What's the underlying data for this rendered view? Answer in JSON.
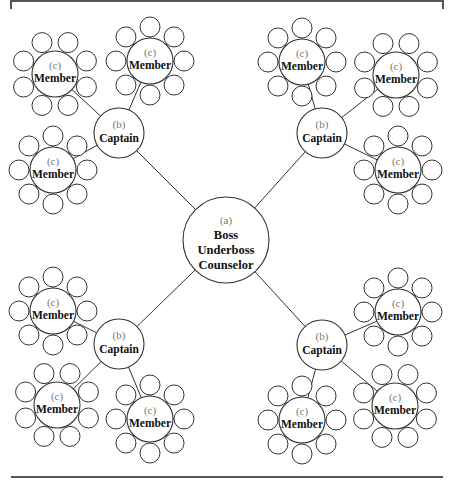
{
  "diagram": {
    "type": "hierarchy",
    "center": {
      "tag": "(a)",
      "lines": [
        "Boss",
        "Underboss",
        "Counselor"
      ]
    },
    "captain": {
      "tag": "(b)",
      "label": "Captain"
    },
    "member": {
      "tag": "(c)",
      "label": "Member"
    },
    "satellites_per_member": 8,
    "groups": [
      {
        "quadrant": "top-left",
        "members": 3
      },
      {
        "quadrant": "top-right",
        "members": 3
      },
      {
        "quadrant": "bottom-left",
        "members": 3
      },
      {
        "quadrant": "bottom-right",
        "members": 3
      }
    ]
  }
}
